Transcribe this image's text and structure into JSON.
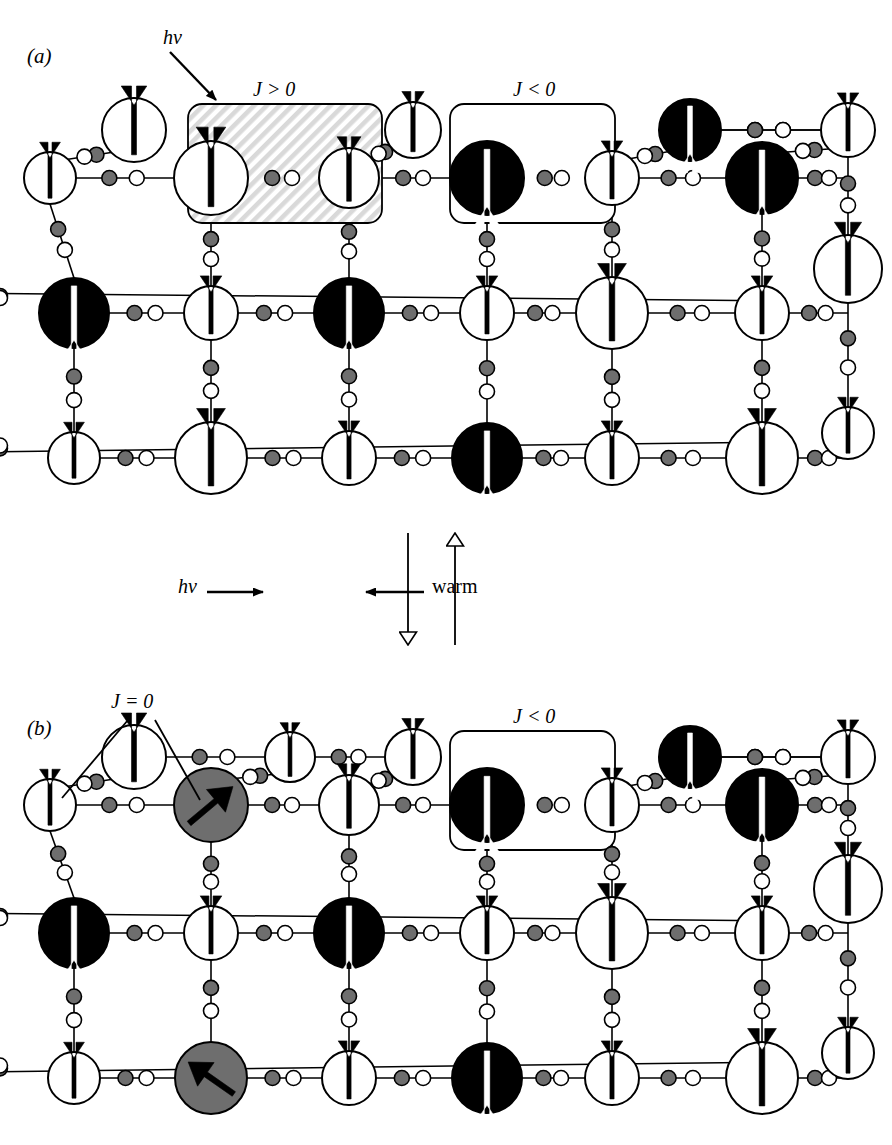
{
  "figure": {
    "width": 892,
    "height": 1145,
    "background": "#ffffff",
    "ink": "#000000",
    "gray_fill": "#6e6e6e",
    "hatch_fill": "#d9d9d9"
  },
  "panels": [
    {
      "id": "a",
      "tag": "(a)",
      "tag_pos": [
        27,
        44
      ],
      "labels": [
        {
          "name": "hv-label",
          "text": "hν",
          "pos": [
            163,
            36
          ],
          "style": "hv"
        },
        {
          "name": "j-positive-label",
          "text": "J > 0",
          "pos": [
            253,
            88
          ],
          "style": "jlbl"
        },
        {
          "name": "j-negative-label",
          "text": "J < 0",
          "pos": [
            513,
            88
          ],
          "style": "jlbl"
        }
      ],
      "boxes": [
        {
          "name": "j-positive-box",
          "kind": "hatched",
          "x": 188,
          "y": 104,
          "w": 194,
          "h": 119,
          "r": 14
        },
        {
          "name": "j-negative-box",
          "kind": "plain",
          "x": 450,
          "y": 104,
          "w": 165,
          "h": 119,
          "r": 14
        }
      ],
      "arrow_annotation": {
        "name": "hv-arrow",
        "from": [
          170,
          52
        ],
        "to": [
          216,
          100
        ]
      },
      "back_row": {
        "y": 130,
        "nodes": [
          {
            "name": "spin-node",
            "x": 134,
            "r": 32,
            "fill": "white",
            "spin": "up"
          },
          {
            "name": "spin-node",
            "x": 413,
            "r": 28,
            "fill": "white",
            "spin": "up"
          },
          {
            "name": "spin-node",
            "x": 690,
            "r": 31,
            "fill": "black",
            "spin": "down"
          },
          {
            "name": "spin-node",
            "x": 848,
            "r": 27,
            "fill": "white",
            "spin": "up"
          }
        ]
      },
      "rows": [
        {
          "y": 178,
          "nodes": [
            {
              "name": "spin-node",
              "x": 50,
              "r": 26,
              "fill": "white",
              "spin": "up"
            },
            {
              "name": "spin-node",
              "x": 211,
              "r": 37,
              "fill": "white",
              "spin": "up"
            },
            {
              "name": "spin-node",
              "x": 349,
              "r": 30,
              "fill": "white",
              "spin": "up"
            },
            {
              "name": "spin-node",
              "x": 487,
              "r": 37,
              "fill": "black",
              "spin": "down"
            },
            {
              "name": "spin-node",
              "x": 612,
              "r": 27,
              "fill": "white",
              "spin": "up"
            },
            {
              "name": "spin-node",
              "x": 762,
              "r": 36,
              "fill": "black",
              "spin": "down"
            }
          ]
        },
        {
          "y": 313,
          "nodes": [
            {
              "name": "spin-node",
              "x": 74,
              "r": 35,
              "fill": "black",
              "spin": "down"
            },
            {
              "name": "spin-node",
              "x": 211,
              "r": 27,
              "fill": "white",
              "spin": "up"
            },
            {
              "name": "spin-node",
              "x": 349,
              "r": 35,
              "fill": "black",
              "spin": "down"
            },
            {
              "name": "spin-node",
              "x": 487,
              "r": 27,
              "fill": "white",
              "spin": "up"
            },
            {
              "name": "spin-node",
              "x": 612,
              "r": 36,
              "fill": "white",
              "spin": "up"
            },
            {
              "name": "spin-node",
              "x": 762,
              "r": 27,
              "fill": "white",
              "spin": "up"
            }
          ]
        },
        {
          "y": 458,
          "nodes": [
            {
              "name": "spin-node",
              "x": 74,
              "r": 26,
              "fill": "white",
              "spin": "up"
            },
            {
              "name": "spin-node",
              "x": 211,
              "r": 36,
              "fill": "white",
              "spin": "up"
            },
            {
              "name": "spin-node",
              "x": 349,
              "r": 27,
              "fill": "white",
              "spin": "up"
            },
            {
              "name": "spin-node",
              "x": 487,
              "r": 35,
              "fill": "black",
              "spin": "down"
            },
            {
              "name": "spin-node",
              "x": 612,
              "r": 27,
              "fill": "white",
              "spin": "up"
            },
            {
              "name": "spin-node",
              "x": 762,
              "r": 36,
              "fill": "white",
              "spin": "up"
            }
          ]
        }
      ],
      "right_column": {
        "x": 848,
        "nodes": [
          {
            "name": "spin-node",
            "y": 269,
            "r": 34,
            "fill": "white",
            "spin": "up"
          },
          {
            "name": "spin-node",
            "y": 433,
            "r": 26,
            "fill": "white",
            "spin": "up"
          }
        ]
      }
    },
    {
      "id": "b",
      "tag": "(b)",
      "tag_pos": [
        27,
        716
      ],
      "labels": [
        {
          "name": "j-zero-label",
          "text": "J = 0",
          "pos": [
            115,
            703
          ],
          "style": "jlbl"
        },
        {
          "name": "j-negative-label",
          "text": "J < 0",
          "pos": [
            513,
            715
          ],
          "style": "jlbl"
        }
      ],
      "boxes": [
        {
          "name": "j-negative-box",
          "kind": "plain",
          "x": 450,
          "y": 731,
          "w": 165,
          "h": 119,
          "r": 14
        }
      ],
      "leaders": [
        {
          "name": "j-zero-leader-left",
          "from": [
            128,
            720
          ],
          "to": [
            62,
            798
          ]
        },
        {
          "name": "j-zero-leader-right",
          "from": [
            155,
            720
          ],
          "to": [
            200,
            800
          ]
        }
      ],
      "back_row": {
        "y": 757,
        "nodes": [
          {
            "name": "spin-node",
            "x": 134,
            "r": 32,
            "fill": "white",
            "spin": "up"
          },
          {
            "name": "spin-node",
            "x": 290,
            "r": 25,
            "fill": "white",
            "spin": "up"
          },
          {
            "name": "spin-node",
            "x": 413,
            "r": 28,
            "fill": "white",
            "spin": "up"
          },
          {
            "name": "spin-node",
            "x": 690,
            "r": 31,
            "fill": "black",
            "spin": "down"
          },
          {
            "name": "spin-node",
            "x": 848,
            "r": 27,
            "fill": "white",
            "spin": "up"
          }
        ]
      },
      "rows": [
        {
          "y": 805,
          "nodes": [
            {
              "name": "spin-node",
              "x": 50,
              "r": 26,
              "fill": "white",
              "spin": "up"
            },
            {
              "name": "spin-node",
              "x": 211,
              "r": 37,
              "fill": "gray",
              "spin": "diag-ne"
            },
            {
              "name": "spin-node",
              "x": 349,
              "r": 30,
              "fill": "white",
              "spin": "up"
            },
            {
              "name": "spin-node",
              "x": 487,
              "r": 37,
              "fill": "black",
              "spin": "down"
            },
            {
              "name": "spin-node",
              "x": 612,
              "r": 27,
              "fill": "white",
              "spin": "up"
            },
            {
              "name": "spin-node",
              "x": 762,
              "r": 36,
              "fill": "black",
              "spin": "down"
            }
          ]
        },
        {
          "y": 933,
          "nodes": [
            {
              "name": "spin-node",
              "x": 74,
              "r": 35,
              "fill": "black",
              "spin": "down"
            },
            {
              "name": "spin-node",
              "x": 211,
              "r": 27,
              "fill": "white",
              "spin": "up"
            },
            {
              "name": "spin-node",
              "x": 349,
              "r": 35,
              "fill": "black",
              "spin": "down"
            },
            {
              "name": "spin-node",
              "x": 487,
              "r": 27,
              "fill": "white",
              "spin": "up"
            },
            {
              "name": "spin-node",
              "x": 612,
              "r": 36,
              "fill": "white",
              "spin": "up"
            },
            {
              "name": "spin-node",
              "x": 762,
              "r": 27,
              "fill": "white",
              "spin": "up"
            }
          ]
        },
        {
          "y": 1078,
          "nodes": [
            {
              "name": "spin-node",
              "x": 74,
              "r": 26,
              "fill": "white",
              "spin": "up"
            },
            {
              "name": "spin-node",
              "x": 211,
              "r": 36,
              "fill": "gray",
              "spin": "diag-nw"
            },
            {
              "name": "spin-node",
              "x": 349,
              "r": 27,
              "fill": "white",
              "spin": "up"
            },
            {
              "name": "spin-node",
              "x": 487,
              "r": 35,
              "fill": "black",
              "spin": "down"
            },
            {
              "name": "spin-node",
              "x": 612,
              "r": 27,
              "fill": "white",
              "spin": "up"
            },
            {
              "name": "spin-node",
              "x": 762,
              "r": 36,
              "fill": "white",
              "spin": "up"
            }
          ]
        }
      ],
      "right_column": {
        "x": 848,
        "nodes": [
          {
            "name": "spin-node",
            "y": 889,
            "r": 34,
            "fill": "white",
            "spin": "up"
          },
          {
            "name": "spin-node",
            "y": 1053,
            "r": 26,
            "fill": "white",
            "spin": "up"
          }
        ]
      }
    }
  ],
  "transition": {
    "name": "transition-arrows",
    "left_label": {
      "name": "hv-transition-label",
      "text": "hν",
      "pos": [
        178,
        585
      ]
    },
    "right_label": {
      "name": "warm-transition-label",
      "text": "warm",
      "pos": [
        432,
        585
      ]
    },
    "left_arrow": {
      "name": "hv-right-arrow",
      "from": [
        207,
        592
      ],
      "to": [
        263,
        592
      ],
      "head": "solid"
    },
    "right_arrow": {
      "name": "warm-left-arrow",
      "from": [
        424,
        592
      ],
      "to": [
        366,
        592
      ],
      "head": "solid"
    },
    "down_arrow": {
      "name": "down-open-arrow",
      "from": [
        408,
        533
      ],
      "to": [
        408,
        645
      ],
      "head": "open"
    },
    "up_arrow": {
      "name": "up-open-arrow",
      "from": [
        455,
        645
      ],
      "to": [
        455,
        533
      ],
      "head": "open"
    }
  },
  "legend_semantics": {
    "white_node": "spin-up metal site",
    "black_node": "spin-down metal site",
    "gray_node": "diamagnetic / photo-excited site",
    "small_gray_circle": "bridging ligand atom",
    "small_white_circle": "bridging ligand atom"
  }
}
